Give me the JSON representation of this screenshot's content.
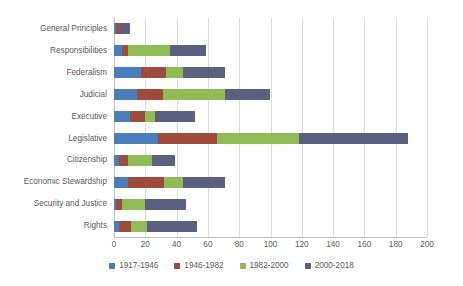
{
  "chart_data": {
    "type": "bar",
    "orientation": "horizontal",
    "stacked": true,
    "title": "",
    "subtitle": "",
    "xlabel": "",
    "ylabel": "",
    "xlim": [
      0,
      200
    ],
    "ylim": null,
    "grid": true,
    "grid_axis": "x",
    "legend_position": "bottom",
    "xticks": [
      0,
      20,
      40,
      60,
      80,
      100,
      120,
      140,
      160,
      180,
      200
    ],
    "xtick_labels": [
      "0",
      "20",
      "40",
      "60",
      "80",
      "100",
      "120",
      "140",
      "160",
      "180",
      "200"
    ],
    "categories": [
      "General Principles",
      "Responsibilities",
      "Federalism",
      "Judicial",
      "Executive",
      "Legislative",
      "Citizenship",
      "Economic  Stewardship",
      "Security and Justice",
      "Rights"
    ],
    "series": [
      {
        "name": "1917-1946",
        "color": "#4A7EBB",
        "values": [
          1,
          5,
          17,
          15,
          10,
          28,
          3,
          9,
          1,
          3
        ]
      },
      {
        "name": "1946-1982",
        "color": "#9E4A3C",
        "values": [
          3,
          4,
          16,
          16,
          10,
          38,
          6,
          23,
          4,
          8
        ]
      },
      {
        "name": "1982-2000",
        "color": "#8FBC54",
        "values": [
          0,
          27,
          11,
          40,
          6,
          52,
          15,
          12,
          15,
          10
        ]
      },
      {
        "name": "2000-2018",
        "color": "#5C6080",
        "values": [
          6,
          23,
          27,
          29,
          26,
          70,
          15,
          27,
          26,
          32
        ]
      }
    ],
    "totals": [
      10,
      59,
      71,
      100,
      52,
      188,
      39,
      71,
      46,
      53
    ]
  },
  "legend": {
    "entries": [
      {
        "label": "1917-1946",
        "color": "#4A7EBB"
      },
      {
        "label": "1946-1982",
        "color": "#9E4A3C"
      },
      {
        "label": "1982-2000",
        "color": "#8FBC54"
      },
      {
        "label": "2000-2018",
        "color": "#5C6080"
      }
    ]
  },
  "style": {
    "background": "#ffffff",
    "text_color": "#595959",
    "grid_color": "#d9d9d9",
    "axis_color": "#bfbfbf"
  }
}
